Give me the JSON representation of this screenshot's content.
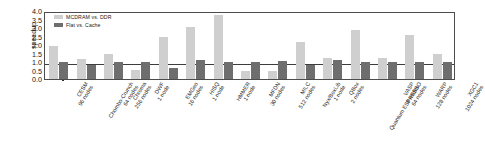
{
  "chart_data": {
    "type": "bar",
    "title": "",
    "xlabel": "",
    "ylabel": "speedup",
    "ylim": [
      0.0,
      4.0
    ],
    "ytick_labels": [
      "0.0",
      "0.5",
      "1.0",
      "1.5",
      "2.0",
      "2.5",
      "3.0",
      "3.5",
      "4.0"
    ],
    "ytick_values": [
      0.0,
      0.5,
      1.0,
      1.5,
      2.0,
      2.5,
      3.0,
      3.5,
      4.0
    ],
    "grid": false,
    "legend_position": "upper left",
    "reference_line": 1.0,
    "categories": [
      "CESM 96 nodes",
      "Chombo-Crunch 64 nodes",
      "Chroma 256 nodes",
      "DWF 1 node",
      "EMGeo 16 nodes",
      "HISQ 1 node",
      "HMMER 1 node",
      "MFDN 30 nodes",
      "MILC 512 nodes",
      "Nyx/BoxLib 1 node",
      "QBox 2 nodes",
      "Quantum ESPRESSO 64 nodes",
      "VASP 8 nodes",
      "WARP 128 nodes",
      "XGC1 1024 nodes"
    ],
    "category_lines": [
      [
        "CESM",
        "96 nodes"
      ],
      [
        "Chombo-Crunch",
        "64 nodes"
      ],
      [
        "Chroma",
        "256 nodes"
      ],
      [
        "DWF",
        "1 node"
      ],
      [
        "EMGeo",
        "16 nodes"
      ],
      [
        "HISQ",
        "1 node"
      ],
      [
        "HMMER",
        "1 node"
      ],
      [
        "MFDN",
        "30 nodes"
      ],
      [
        "MILC",
        "512 nodes"
      ],
      [
        "Nyx/BoxLib",
        "1 node"
      ],
      [
        "QBox",
        "2 nodes"
      ],
      [
        "Quantum ESPRESSO",
        "64 nodes"
      ],
      [
        "VASP",
        "8 nodes"
      ],
      [
        "WARP",
        "128 nodes"
      ],
      [
        "XGC1",
        "1024 nodes"
      ]
    ],
    "series": [
      {
        "name": "MCDRAM vs. DDR",
        "color": "#cfcfcf",
        "values": [
          1.95,
          1.2,
          1.5,
          0.55,
          2.5,
          3.05,
          3.75,
          0.5,
          0.5,
          2.2,
          1.25,
          2.9,
          1.25,
          2.6,
          1.45
        ]
      },
      {
        "name": "Flat vs. Cache",
        "color": "#6e6e6e",
        "values": [
          1.0,
          0.85,
          1.0,
          1.0,
          0.65,
          1.1,
          1.0,
          1.0,
          1.05,
          0.8,
          1.1,
          1.0,
          1.0,
          1.0,
          1.0
        ]
      }
    ]
  },
  "legend": {
    "entries": [
      {
        "label": "MCDRAM vs. DDR",
        "color": "#cfcfcf"
      },
      {
        "label": "Flat vs. Cache",
        "color": "#6e6e6e"
      }
    ]
  }
}
